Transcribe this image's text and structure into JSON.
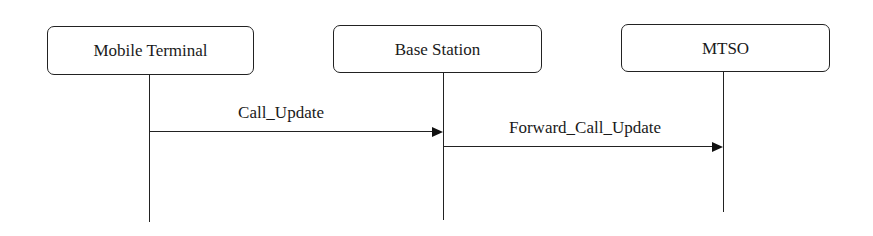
{
  "diagram": {
    "type": "sequence",
    "participants": [
      {
        "id": "mobile_terminal",
        "label": "Mobile Terminal"
      },
      {
        "id": "base_station",
        "label": "Base Station"
      },
      {
        "id": "mtso",
        "label": "MTSO"
      }
    ],
    "messages": [
      {
        "from": "mobile_terminal",
        "to": "base_station",
        "label": "Call_Update"
      },
      {
        "from": "base_station",
        "to": "mtso",
        "label": "Forward_Call_Update"
      }
    ]
  }
}
